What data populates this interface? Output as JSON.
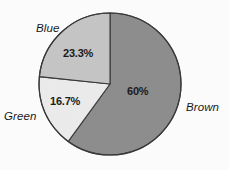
{
  "chart_data": {
    "type": "pie",
    "title": "",
    "subtitle": "",
    "xlabel": "",
    "ylabel": "",
    "legend_position": "none",
    "grid": false,
    "categories": [
      "Brown",
      "Blue",
      "Green"
    ],
    "values": [
      60,
      23.3,
      16.7
    ],
    "value_labels": [
      "60%",
      "23.3%",
      "16.7%"
    ],
    "units": "percent",
    "start_angle_deg": 0,
    "direction": "clockwise",
    "slices": [
      {
        "name": "Brown",
        "label": "Brown",
        "value": 60,
        "value_label": "60%",
        "start_deg": 0,
        "sweep_deg": 216,
        "fill": "#8e8e8e",
        "stroke": "#3a3a3a",
        "label_position": "outside-right",
        "value_label_position": "inside"
      },
      {
        "name": "Green",
        "label": "Green",
        "value": 16.7,
        "value_label": "16.7%",
        "start_deg": 216,
        "sweep_deg": 60,
        "fill": "#ececec",
        "stroke": "#3a3a3a",
        "label_position": "outside-left",
        "value_label_position": "inside"
      },
      {
        "name": "Blue",
        "label": "Blue",
        "value": 23.3,
        "value_label": "23.3%",
        "start_deg": 276,
        "sweep_deg": 84,
        "fill": "#c6c6c6",
        "stroke": "#3a3a3a",
        "label_position": "outside-top-left",
        "value_label_position": "inside"
      }
    ],
    "geometry": {
      "center_x": 110,
      "center_y": 84,
      "radius": 71
    },
    "colors": {
      "brown_slice": "#8e8e8e",
      "blue_slice": "#c6c6c6",
      "green_slice": "#ececec",
      "outline": "#3a3a3a",
      "text": "#1c1c1c",
      "background": "#fdfdfd"
    }
  }
}
